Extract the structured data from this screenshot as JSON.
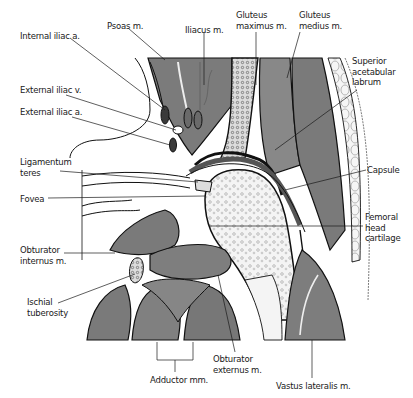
{
  "figure": {
    "colors": {
      "muscle": "#7a7a7a",
      "muscle_light": "#9a9a9a",
      "vessel": "#3a3a3a",
      "bone_marrow": "#f2f2f2",
      "outline": "#111111",
      "background": "#ffffff"
    }
  },
  "labels": [
    {
      "id": "internal-iliac-a",
      "text": "Internal iliac a.",
      "x": 20,
      "y": 31
    },
    {
      "id": "psoas-m",
      "text": "Psoas m.",
      "x": 107,
      "y": 21
    },
    {
      "id": "iliacus-m",
      "text": "Iliacus m.",
      "x": 185,
      "y": 25
    },
    {
      "id": "gluteus-maximus-m",
      "text": "Gluteus\nmaximus m.",
      "x": 236,
      "y": 10
    },
    {
      "id": "gluteus-medius-m",
      "text": "Gluteus\nmedius m.",
      "x": 299,
      "y": 10
    },
    {
      "id": "superior-acetabular-labrum",
      "text": "Superior\nacetabular\nlabrum",
      "x": 352,
      "y": 56
    },
    {
      "id": "external-iliac-v",
      "text": "External iliac v.",
      "x": 20,
      "y": 85
    },
    {
      "id": "external-iliac-a",
      "text": "External iliac a.",
      "x": 20,
      "y": 107
    },
    {
      "id": "ligamentum-teres",
      "text": "Ligamentum\nteres",
      "x": 20,
      "y": 157
    },
    {
      "id": "fovea",
      "text": "Fovea",
      "x": 20,
      "y": 194
    },
    {
      "id": "capsule",
      "text": "Capsule",
      "x": 367,
      "y": 167
    },
    {
      "id": "femoral-head-cartilage",
      "text": "Femoral\nhead\ncartilage",
      "x": 365,
      "y": 214
    },
    {
      "id": "obturator-internus-m",
      "text": "Obturator\ninternus m.",
      "x": 20,
      "y": 245
    },
    {
      "id": "ischial-tuberosity",
      "text": "Ischial\ntuberosity",
      "x": 27,
      "y": 297
    },
    {
      "id": "obturator-externus-m",
      "text": "Obturator\nexternus m.",
      "x": 213,
      "y": 354
    },
    {
      "id": "adductor-mm",
      "text": "Adductor mm.",
      "x": 150,
      "y": 375
    },
    {
      "id": "vastus-lateralis-m",
      "text": "Vastus lateralis m.",
      "x": 276,
      "y": 381
    }
  ]
}
